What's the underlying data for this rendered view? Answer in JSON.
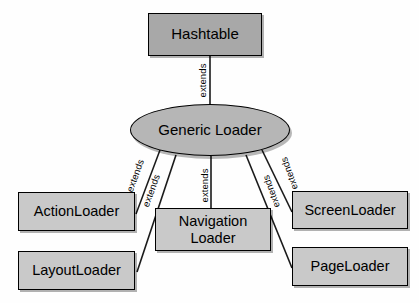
{
  "diagram": {
    "background_color": "#fefefe",
    "root": {
      "id": "hashtable",
      "label": "Hashtable",
      "fill_color": "#a8a8a8",
      "shape": "rectangle"
    },
    "center": {
      "id": "generic-loader",
      "label": "Generic Loader",
      "fill_color": "#b6b6b6",
      "shape": "ellipse"
    },
    "leaves": [
      {
        "id": "actionloader",
        "label": "ActionLoader",
        "fill_color": "#c9c9c9",
        "shape": "rectangle"
      },
      {
        "id": "layoutloader",
        "label": "LayoutLoader",
        "fill_color": "#c9c9c9",
        "shape": "rectangle"
      },
      {
        "id": "navigationloader",
        "label": "Navigation\nLoader",
        "fill_color": "#c9c9c9",
        "shape": "rectangle"
      },
      {
        "id": "screenloader",
        "label": "ScreenLoader",
        "fill_color": "#c9c9c9",
        "shape": "rectangle"
      },
      {
        "id": "pageloader",
        "label": "PageLoader",
        "fill_color": "#c9c9c9",
        "shape": "rectangle"
      }
    ],
    "edges": [
      {
        "id": "edge-hashtable",
        "from": "generic-loader",
        "to": "hashtable",
        "label": "extends"
      },
      {
        "id": "edge-actionloader",
        "from": "actionloader",
        "to": "generic-loader",
        "label": "extends"
      },
      {
        "id": "edge-layoutloader",
        "from": "layoutloader",
        "to": "generic-loader",
        "label": "extends"
      },
      {
        "id": "edge-navigationloader",
        "from": "navigationloader",
        "to": "generic-loader",
        "label": "extends"
      },
      {
        "id": "edge-screenloader",
        "from": "screenloader",
        "to": "generic-loader",
        "label": "extends"
      },
      {
        "id": "edge-pageloader",
        "from": "pageloader",
        "to": "generic-loader",
        "label": "extends"
      }
    ],
    "edge_color": "#1a1a1a",
    "border_color": "#000000"
  }
}
